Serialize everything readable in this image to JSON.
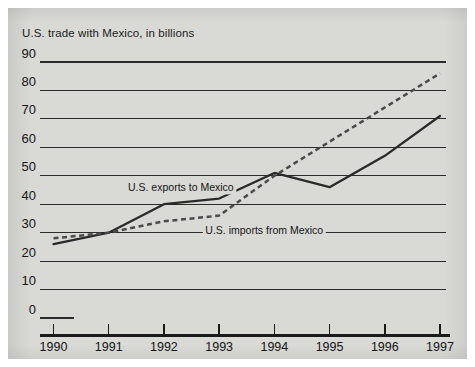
{
  "figure": {
    "title": "U.S. trade with Mexico, in billions",
    "panel_color": "#d9d9d6",
    "page_color": "#ffffff"
  },
  "chart_data": {
    "type": "line",
    "title": "U.S. trade with Mexico, in billions",
    "xlabel": "",
    "ylabel": "",
    "x": [
      1990,
      1991,
      1992,
      1993,
      1994,
      1995,
      1996,
      1997
    ],
    "xtick_labels": [
      "1990",
      "1991",
      "1992",
      "1993",
      "1994",
      "1995",
      "1996",
      "1997"
    ],
    "ytick_labels": [
      "0",
      "10",
      "20",
      "30",
      "40",
      "50",
      "60",
      "70",
      "80",
      "90"
    ],
    "ytick_values": [
      0,
      10,
      20,
      30,
      40,
      50,
      60,
      70,
      80,
      90
    ],
    "ylim": [
      0,
      90
    ],
    "xlim": [
      1990,
      1997
    ],
    "grid": "horizontal",
    "legend_position": "inline-annotations",
    "series": [
      {
        "name": "U.S. exports to Mexico",
        "style": "solid",
        "color": "#2a2a2a",
        "values": [
          26,
          30,
          40,
          42,
          51,
          46,
          57,
          71
        ]
      },
      {
        "name": "U.S. imports from Mexico",
        "style": "dashed",
        "color": "#4a4a4a",
        "values": [
          28,
          30,
          34,
          36,
          50,
          62,
          74,
          86
        ]
      }
    ],
    "annotations": [
      {
        "text": "U.S. exports to Mexico",
        "x": 1991.35,
        "y": 44.5
      },
      {
        "text": "U.S. imports from Mexico",
        "x": 1992.75,
        "y": 29.5
      }
    ]
  },
  "axis": {
    "y_labels": [
      "90",
      "80",
      "70",
      "60",
      "50",
      "40",
      "30",
      "20",
      "10",
      "0"
    ],
    "x_labels": [
      "1990",
      "1991",
      "1992",
      "1993",
      "1994",
      "1995",
      "1996",
      "1997"
    ]
  }
}
